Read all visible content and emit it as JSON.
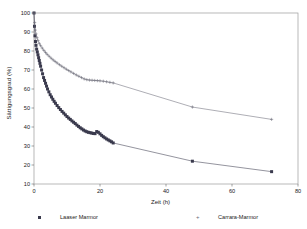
{
  "chart_data": {
    "type": "scatter",
    "title": "",
    "xlabel": "Zeit (h)",
    "ylabel": "Sättigungsgrad (%)",
    "xlim": [
      0,
      80
    ],
    "ylim": [
      10,
      100
    ],
    "xticks": [
      0,
      20,
      40,
      60,
      80
    ],
    "yticks": [
      10,
      20,
      30,
      40,
      50,
      60,
      70,
      80,
      90,
      100
    ],
    "grid": false,
    "legend_position": "bottom",
    "series": [
      {
        "name": "Laaser Marmor",
        "marker": "square",
        "color": "#3a3a4d",
        "points": [
          [
            0.0,
            100.0
          ],
          [
            0.15,
            93.0
          ],
          [
            0.3,
            88.0
          ],
          [
            0.45,
            85.0
          ],
          [
            0.6,
            83.0
          ],
          [
            0.8,
            81.0
          ],
          [
            1.0,
            79.5
          ],
          [
            1.2,
            78.0
          ],
          [
            1.4,
            76.5
          ],
          [
            1.6,
            75.0
          ],
          [
            1.8,
            73.5
          ],
          [
            2.0,
            72.0
          ],
          [
            2.3,
            70.0
          ],
          [
            2.6,
            68.0
          ],
          [
            2.9,
            66.0
          ],
          [
            3.2,
            64.5
          ],
          [
            3.5,
            63.0
          ],
          [
            3.8,
            61.5
          ],
          [
            4.1,
            60.0
          ],
          [
            4.5,
            58.5
          ],
          [
            4.9,
            57.0
          ],
          [
            5.3,
            55.8
          ],
          [
            5.7,
            54.6
          ],
          [
            6.1,
            53.5
          ],
          [
            6.5,
            52.5
          ],
          [
            7.0,
            51.3
          ],
          [
            7.5,
            50.2
          ],
          [
            8.0,
            49.2
          ],
          [
            8.5,
            48.2
          ],
          [
            9.0,
            47.3
          ],
          [
            9.5,
            46.4
          ],
          [
            10.0,
            45.5
          ],
          [
            10.5,
            44.7
          ],
          [
            11.0,
            44.0
          ],
          [
            11.5,
            43.2
          ],
          [
            12.0,
            42.5
          ],
          [
            12.5,
            41.8
          ],
          [
            13.0,
            41.0
          ],
          [
            13.5,
            40.3
          ],
          [
            14.0,
            39.6
          ],
          [
            14.5,
            39.0
          ],
          [
            15.0,
            38.4
          ],
          [
            15.5,
            37.9
          ],
          [
            16.0,
            37.5
          ],
          [
            16.5,
            37.2
          ],
          [
            17.0,
            37.0
          ],
          [
            17.5,
            36.8
          ],
          [
            18.0,
            36.6
          ],
          [
            18.5,
            36.5
          ],
          [
            19.0,
            37.6
          ],
          [
            19.5,
            37.2
          ],
          [
            20.0,
            36.4
          ],
          [
            20.5,
            35.6
          ],
          [
            21.0,
            34.9
          ],
          [
            21.5,
            34.3
          ],
          [
            22.0,
            33.7
          ],
          [
            22.5,
            33.2
          ],
          [
            23.0,
            32.7
          ],
          [
            23.5,
            32.2
          ],
          [
            24.0,
            31.6
          ],
          [
            48.0,
            22.0
          ],
          [
            72.0,
            16.5
          ]
        ]
      },
      {
        "name": "Carrara-Marmor",
        "marker": "plus",
        "color": "#6b6b78",
        "points": [
          [
            0.0,
            100.0
          ],
          [
            0.2,
            95.0
          ],
          [
            0.4,
            91.0
          ],
          [
            0.6,
            89.0
          ],
          [
            0.9,
            87.0
          ],
          [
            1.2,
            85.5
          ],
          [
            1.6,
            84.0
          ],
          [
            2.0,
            82.8
          ],
          [
            2.5,
            81.5
          ],
          [
            3.0,
            80.3
          ],
          [
            3.5,
            79.2
          ],
          [
            4.0,
            78.2
          ],
          [
            4.6,
            77.2
          ],
          [
            5.2,
            76.2
          ],
          [
            5.8,
            75.3
          ],
          [
            6.4,
            74.5
          ],
          [
            7.0,
            73.7
          ],
          [
            7.7,
            72.8
          ],
          [
            8.4,
            72.0
          ],
          [
            9.1,
            71.2
          ],
          [
            9.8,
            70.4
          ],
          [
            10.5,
            69.7
          ],
          [
            11.2,
            69.0
          ],
          [
            12.0,
            68.2
          ],
          [
            12.8,
            67.4
          ],
          [
            13.6,
            66.7
          ],
          [
            14.4,
            66.0
          ],
          [
            15.2,
            65.3
          ],
          [
            16.0,
            64.9
          ],
          [
            16.8,
            64.7
          ],
          [
            17.6,
            64.6
          ],
          [
            18.4,
            64.5
          ],
          [
            19.2,
            64.4
          ],
          [
            20.0,
            64.3
          ],
          [
            21.0,
            64.1
          ],
          [
            22.0,
            63.8
          ],
          [
            23.0,
            63.5
          ],
          [
            24.0,
            63.2
          ],
          [
            48.0,
            50.5
          ],
          [
            72.0,
            44.0
          ]
        ]
      }
    ]
  },
  "axis": {
    "xlabel_text": "Zeit (h)",
    "ylabel_text": "Sättigungsgrad (%)"
  },
  "legend": {
    "entries": [
      {
        "label": "Laaser Marmor",
        "marker": "square-marker-icon"
      },
      {
        "label": "Carrara-Marmor",
        "marker": "plus-marker-icon"
      }
    ]
  }
}
